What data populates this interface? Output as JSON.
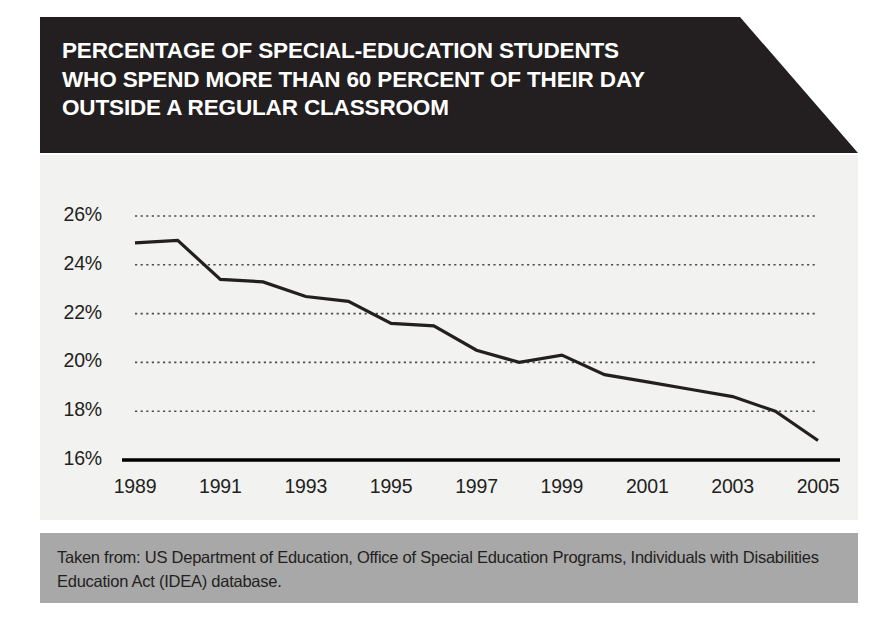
{
  "title": {
    "lines": [
      "PERCENTAGE OF SPECIAL-EDUCATION STUDENTS",
      "WHO SPEND MORE THAN 60 PERCENT OF THEIR DAY",
      "OUTSIDE A REGULAR CLASSROOM"
    ],
    "full": "PERCENTAGE OF SPECIAL-EDUCATION STUDENTS WHO SPEND MORE THAN 60 PERCENT OF THEIR DAY OUTSIDE A REGULAR CLASSROOM"
  },
  "caption": {
    "lines": [
      "Taken from: US Department of Education, Office of Special Education Programs, Individuals",
      "with Disabilities Education Act (IDEA) database."
    ],
    "full": "Taken from: US Department of Education, Office of Special Education Programs, Individuals with Disabilities Education Act (IDEA) database."
  },
  "colors": {
    "banner_background": "#231f20",
    "banner_text": "#ffffff",
    "panel_background": "#f2f2f1",
    "caption_background": "#a8a8a8",
    "line": "#231f20",
    "gridline": "#4d4d4d",
    "axis": "#000000",
    "page_background": "#ffffff"
  },
  "chart_data": {
    "type": "line",
    "title": "PERCENTAGE OF SPECIAL-EDUCATION STUDENTS WHO SPEND MORE THAN 60 PERCENT OF THEIR DAY OUTSIDE A REGULAR CLASSROOM",
    "xlabel": "",
    "ylabel": "",
    "x": [
      1989,
      1990,
      1991,
      1992,
      1993,
      1994,
      1995,
      1996,
      1997,
      1998,
      1999,
      2000,
      2001,
      2002,
      2003,
      2004,
      2005
    ],
    "values": [
      24.9,
      25.0,
      23.4,
      23.3,
      22.7,
      22.5,
      21.6,
      21.5,
      20.5,
      20.0,
      20.3,
      19.5,
      19.2,
      18.9,
      18.6,
      18.0,
      16.8
    ],
    "series": [
      {
        "name": "Percentage of special-education students outside a regular classroom more than 60% of day",
        "values": [
          24.9,
          25.0,
          23.4,
          23.3,
          22.7,
          22.5,
          21.6,
          21.5,
          20.5,
          20.0,
          20.3,
          19.5,
          19.2,
          18.9,
          18.6,
          18.0,
          16.8
        ]
      }
    ],
    "ylim": [
      16,
      26
    ],
    "xlim": [
      1989,
      2005
    ],
    "yticks": [
      16,
      18,
      20,
      22,
      24,
      26
    ],
    "ytick_labels": [
      "16%",
      "18%",
      "20%",
      "22%",
      "24%",
      "26%"
    ],
    "xticks": [
      1989,
      1991,
      1993,
      1995,
      1997,
      1999,
      2001,
      2003,
      2005
    ],
    "xtick_labels": [
      "1989",
      "1991",
      "1993",
      "1995",
      "1997",
      "1999",
      "2001",
      "2003",
      "2005"
    ],
    "grid": true,
    "grid_style": "dotted-horizontal",
    "legend": false,
    "legend_position": "none"
  }
}
